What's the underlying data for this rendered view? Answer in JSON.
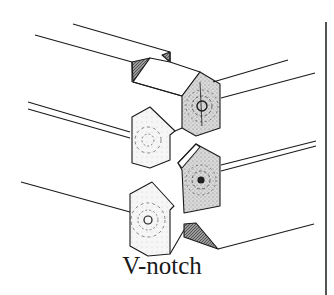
{
  "figure": {
    "caption": "V-notch",
    "colors": {
      "line": "#1a1a1a",
      "shaded_face": "#cfcfcf",
      "light_face": "#f4f4f4",
      "notch_dark": "#8a8a8a",
      "background": "#ffffff"
    }
  }
}
